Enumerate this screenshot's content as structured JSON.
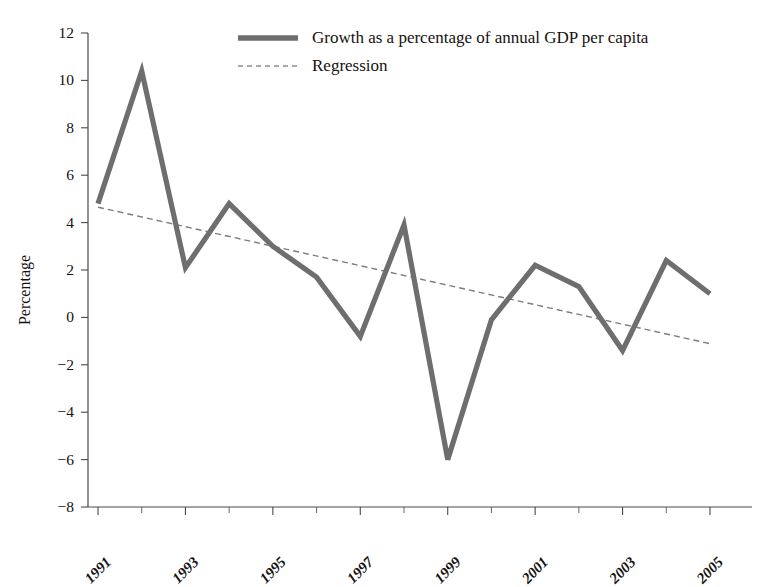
{
  "chart_data": {
    "type": "line",
    "title": "",
    "xlabel": "",
    "ylabel": "Percentage",
    "ylim": [
      -8,
      12
    ],
    "ytick_step": 2,
    "yticks": [
      12,
      10,
      8,
      6,
      4,
      2,
      0,
      -2,
      -4,
      -6,
      -8
    ],
    "ytick_labels": [
      "12",
      "10",
      "8",
      "6",
      "4",
      "2",
      "0",
      "−2",
      "−4",
      "−6",
      "−8"
    ],
    "xlim": [
      1991,
      2005
    ],
    "x": [
      1991,
      1992,
      1993,
      1994,
      1995,
      1996,
      1997,
      1998,
      1999,
      2000,
      2001,
      2002,
      2003,
      2004,
      2005
    ],
    "xticks": [
      1991,
      1992,
      1993,
      1994,
      1995,
      1996,
      1997,
      1998,
      1999,
      2000,
      2001,
      2002,
      2003,
      2004,
      2005
    ],
    "xtick_labels_shown": [
      "1991",
      "1993",
      "1995",
      "1997",
      "1999",
      "2001",
      "2003",
      "2005"
    ],
    "xtick_labels_shown_values": [
      1991,
      1993,
      1995,
      1997,
      1999,
      2001,
      2003,
      2005
    ],
    "grid": false,
    "legend_position": "top-center",
    "series": [
      {
        "name": "Growth as  a percentage of annual GDP per capita",
        "style": "solid-thick",
        "color": "#6e6e6e",
        "values": [
          4.8,
          10.4,
          2.1,
          4.8,
          3.0,
          1.7,
          -0.8,
          3.9,
          -6.0,
          -0.1,
          2.2,
          1.3,
          -1.4,
          2.4,
          1.0
        ]
      },
      {
        "name": "Regression",
        "style": "dashed-thin",
        "color": "#7d7d7d",
        "values": [
          4.65,
          4.24,
          3.83,
          3.42,
          3.0,
          2.59,
          2.18,
          1.77,
          1.36,
          0.95,
          0.53,
          0.12,
          -0.29,
          -0.7,
          -1.11
        ],
        "endpoints": {
          "x_start": 1991,
          "y_start": 4.65,
          "x_end": 2005,
          "y_end": -1.11
        }
      }
    ]
  },
  "axes": {
    "y_axis_title": "Percentage"
  },
  "legend": {
    "entries": [
      {
        "label": "Growth as  a percentage of annual GDP per capita",
        "swatch": "solid-thick-line-swatch"
      },
      {
        "label": "Regression",
        "swatch": "dashed-thin-line-swatch"
      }
    ]
  },
  "colors": {
    "series_line": "#6e6e6e",
    "regression_line": "#7d7d7d",
    "axis": "#4a4a4a",
    "text": "#15120f",
    "background": "#ffffff"
  }
}
